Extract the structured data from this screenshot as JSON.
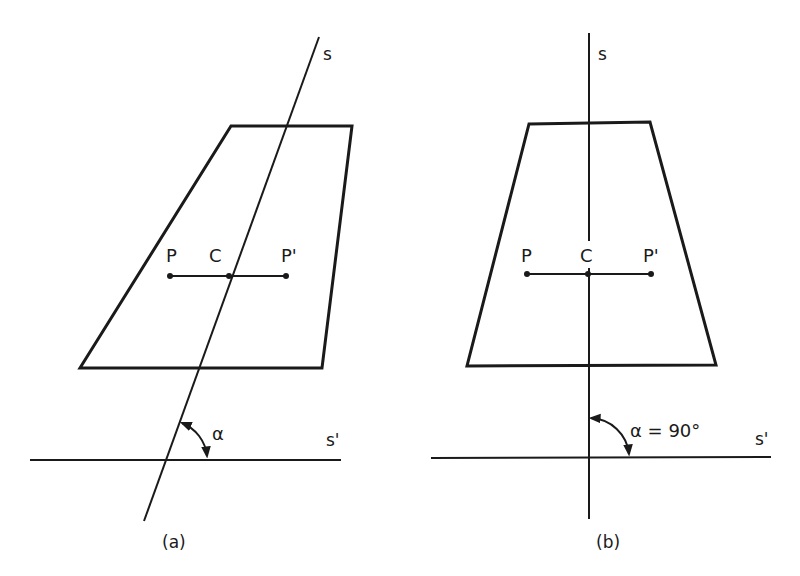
{
  "figure": {
    "panels": [
      {
        "id": "a",
        "caption": "(a)",
        "axis_label": "s",
        "reference_label": "s'",
        "point_left": "P",
        "point_center": "C",
        "point_right": "P'",
        "angle_label": "α"
      },
      {
        "id": "b",
        "caption": "(b)",
        "axis_label": "s",
        "reference_label": "s'",
        "point_left": "P",
        "point_center": "C",
        "point_right": "P'",
        "angle_label": "α = 90°"
      }
    ]
  },
  "colors": {
    "stroke": "#1a1a1a",
    "background": "#ffffff"
  }
}
